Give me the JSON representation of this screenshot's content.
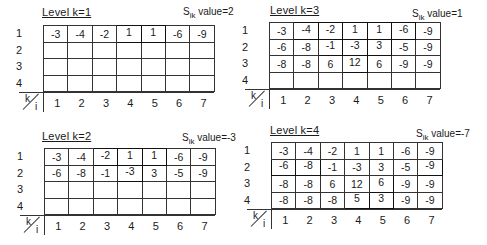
{
  "panels": [
    {
      "id": "k1",
      "title": "Level k=1",
      "sik_prefix": "S",
      "sik_sub": "ik",
      "sik_value": "value=2",
      "row_labels": [
        "1",
        "2",
        "3",
        "4"
      ],
      "col_labels": [
        "1",
        "2",
        "3",
        "4",
        "5",
        "6",
        "7"
      ],
      "axis_k": "k",
      "axis_i": "i",
      "rows": [
        [
          "-3",
          "-4",
          "-2",
          "1",
          "1",
          "-6",
          "-9"
        ],
        [
          "",
          "",
          "",
          "",
          "",
          "",
          ""
        ],
        [
          "",
          "",
          "",
          "",
          "",
          "",
          ""
        ],
        [
          "",
          "",
          "",
          "",
          "",
          "",
          ""
        ]
      ],
      "highlighted": [
        [
          0,
          3
        ],
        [
          0,
          4
        ]
      ]
    },
    {
      "id": "k3",
      "title": "Level k=3",
      "sik_prefix": "S",
      "sik_sub": "ik",
      "sik_value": "value=1",
      "row_labels": [
        "1",
        "2",
        "3",
        "4"
      ],
      "col_labels": [
        "1",
        "2",
        "3",
        "4",
        "5",
        "6",
        "7"
      ],
      "axis_k": "k",
      "axis_i": "i",
      "rows": [
        [
          "-3",
          "-4",
          "-2",
          "1",
          "1",
          "-6",
          "-9"
        ],
        [
          "-6",
          "-8",
          "-1",
          "-3",
          "3",
          "-5",
          "-9"
        ],
        [
          "-8",
          "-8",
          "6",
          "12",
          "6",
          "-9",
          "-9"
        ],
        [
          "",
          "",
          "",
          "",
          "",
          "",
          ""
        ]
      ],
      "highlighted": [
        [
          0,
          1
        ],
        [
          0,
          2
        ],
        [
          0,
          3
        ],
        [
          0,
          4
        ],
        [
          0,
          5
        ],
        [
          1,
          2
        ],
        [
          1,
          3
        ],
        [
          1,
          4
        ],
        [
          2,
          3
        ]
      ]
    },
    {
      "id": "k2",
      "title": "Level k=2",
      "sik_prefix": "S",
      "sik_sub": "ik",
      "sik_value": "value=-3",
      "row_labels": [
        "1",
        "2",
        "3",
        "4"
      ],
      "col_labels": [
        "1",
        "2",
        "3",
        "4",
        "5",
        "6",
        "7"
      ],
      "axis_k": "k",
      "axis_i": "i",
      "rows": [
        [
          "-3",
          "-4",
          "-2",
          "1",
          "1",
          "-6",
          "-9"
        ],
        [
          "-6",
          "-8",
          "-1",
          "-3",
          "3",
          "-5",
          "-9"
        ],
        [
          "",
          "",
          "",
          "",
          "",
          "",
          ""
        ],
        [
          "",
          "",
          "",
          "",
          "",
          "",
          ""
        ]
      ],
      "highlighted": [
        [
          0,
          2
        ],
        [
          0,
          3
        ],
        [
          0,
          4
        ],
        [
          1,
          3
        ]
      ]
    },
    {
      "id": "k4",
      "title": "Level k=4",
      "sik_prefix": "S",
      "sik_sub": "ik",
      "sik_value": "value=-7",
      "row_labels": [
        "1",
        "2",
        "3",
        "4"
      ],
      "col_labels": [
        "1",
        "2",
        "3",
        "4",
        "5",
        "6",
        "7"
      ],
      "axis_k": "k",
      "axis_i": "i",
      "rows": [
        [
          "-3",
          "-4",
          "-2",
          "1",
          "1",
          "-6",
          "-9"
        ],
        [
          "-6",
          "-8",
          "-1",
          "-3",
          "3",
          "-5",
          "-9"
        ],
        [
          "-8",
          "-8",
          "6",
          "12",
          "6",
          "-9",
          "-9"
        ],
        [
          "-8",
          "-8",
          "-8",
          "5",
          "3",
          "-9",
          "-9"
        ]
      ],
      "highlighted": [
        [
          1,
          0
        ],
        [
          1,
          1
        ],
        [
          1,
          6
        ],
        [
          2,
          4
        ],
        [
          3,
          3
        ],
        [
          3,
          4
        ]
      ]
    }
  ]
}
